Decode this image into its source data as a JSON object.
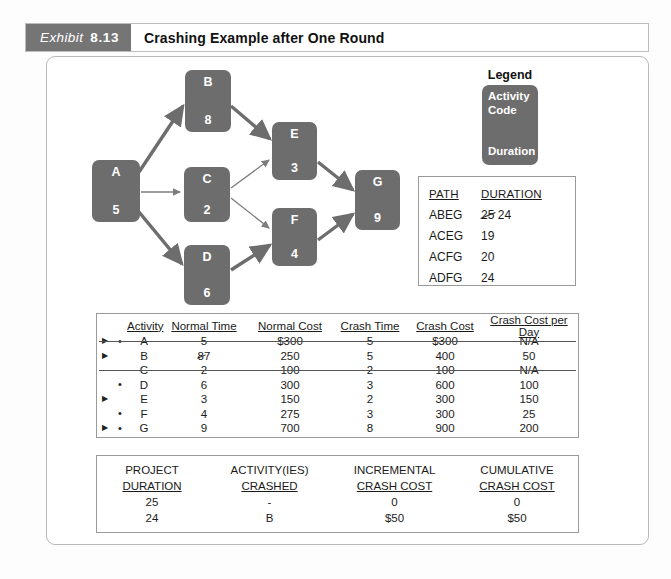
{
  "exhibit": {
    "label": "Exhibit",
    "number": "8.13",
    "title": "Crashing Example after One Round",
    "badge_color": "#757575"
  },
  "diagram": {
    "node_color": "#6d6d6d",
    "nodes": [
      {
        "id": "A",
        "code": "A",
        "duration": "5"
      },
      {
        "id": "B",
        "code": "B",
        "duration": "8"
      },
      {
        "id": "C",
        "code": "C",
        "duration": "2"
      },
      {
        "id": "D",
        "code": "D",
        "duration": "6"
      },
      {
        "id": "E",
        "code": "E",
        "duration": "3"
      },
      {
        "id": "F",
        "code": "F",
        "duration": "4"
      },
      {
        "id": "G",
        "code": "G",
        "duration": "9"
      }
    ],
    "edges": [
      {
        "from": "A",
        "to": "B",
        "critical": true
      },
      {
        "from": "A",
        "to": "C",
        "critical": false
      },
      {
        "from": "A",
        "to": "D",
        "critical": true
      },
      {
        "from": "B",
        "to": "E",
        "critical": true
      },
      {
        "from": "C",
        "to": "E",
        "critical": false
      },
      {
        "from": "C",
        "to": "F",
        "critical": false
      },
      {
        "from": "D",
        "to": "F",
        "critical": true
      },
      {
        "from": "E",
        "to": "G",
        "critical": true
      },
      {
        "from": "F",
        "to": "G",
        "critical": true
      }
    ]
  },
  "legend": {
    "title": "Legend",
    "line1": "Activity",
    "line2": "Code",
    "line3": "Duration"
  },
  "path_table": {
    "headers": {
      "path": "PATH",
      "duration": "DURATION"
    },
    "rows": [
      {
        "path": "ABEG",
        "duration_old": "25",
        "duration": "24",
        "revised": true
      },
      {
        "path": "ACEG",
        "duration_old": "",
        "duration": "19",
        "revised": false
      },
      {
        "path": "ACFG",
        "duration_old": "",
        "duration": "20",
        "revised": false
      },
      {
        "path": "ADFG",
        "duration_old": "",
        "duration": "24",
        "revised": false
      }
    ]
  },
  "activity_table": {
    "headers": {
      "activity": "Activity",
      "normal_time": "Normal Time",
      "normal_cost": "Normal Cost",
      "crash_time": "Crash Time",
      "crash_cost": "Crash Cost",
      "crash_cost_per_day": "Crash Cost per Day"
    },
    "markers": {
      "arrow": "▶",
      "dot": "•"
    },
    "rows": [
      {
        "arrow": true,
        "dot": true,
        "activity": "A",
        "normal_time": "5",
        "normal_time_old": "",
        "normal_cost": "$300",
        "crash_time": "5",
        "crash_cost": "$300",
        "crash_cost_per_day": "N/A",
        "struck": true
      },
      {
        "arrow": true,
        "dot": false,
        "activity": "B",
        "normal_time": "7",
        "normal_time_old": "8",
        "normal_cost": "250",
        "crash_time": "5",
        "crash_cost": "400",
        "crash_cost_per_day": "50",
        "struck": false
      },
      {
        "arrow": false,
        "dot": false,
        "activity": "C",
        "normal_time": "2",
        "normal_time_old": "",
        "normal_cost": "100",
        "crash_time": "2",
        "crash_cost": "100",
        "crash_cost_per_day": "N/A",
        "struck": true
      },
      {
        "arrow": false,
        "dot": true,
        "activity": "D",
        "normal_time": "6",
        "normal_time_old": "",
        "normal_cost": "300",
        "crash_time": "3",
        "crash_cost": "600",
        "crash_cost_per_day": "100",
        "struck": false
      },
      {
        "arrow": true,
        "dot": false,
        "activity": "E",
        "normal_time": "3",
        "normal_time_old": "",
        "normal_cost": "150",
        "crash_time": "2",
        "crash_cost": "300",
        "crash_cost_per_day": "150",
        "struck": false
      },
      {
        "arrow": false,
        "dot": true,
        "activity": "F",
        "normal_time": "4",
        "normal_time_old": "",
        "normal_cost": "275",
        "crash_time": "3",
        "crash_cost": "300",
        "crash_cost_per_day": "25",
        "struck": false
      },
      {
        "arrow": true,
        "dot": true,
        "activity": "G",
        "normal_time": "9",
        "normal_time_old": "",
        "normal_cost": "700",
        "crash_time": "8",
        "crash_cost": "900",
        "crash_cost_per_day": "200",
        "struck": false
      }
    ]
  },
  "summary_table": {
    "headers_line1": {
      "duration": "PROJECT",
      "crashed": "ACTIVITY(IES)",
      "incremental": "INCREMENTAL",
      "cumulative": "CUMULATIVE"
    },
    "headers_line2": {
      "duration": "DURATION",
      "crashed": "CRASHED",
      "incremental": "CRASH COST",
      "cumulative": "CRASH COST"
    },
    "rows": [
      {
        "duration": "25",
        "crashed": "-",
        "incremental": "0",
        "cumulative": "0"
      },
      {
        "duration": "24",
        "crashed": "B",
        "incremental": "$50",
        "cumulative": "$50"
      }
    ]
  }
}
